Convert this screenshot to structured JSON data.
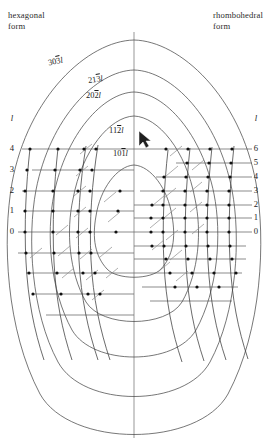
{
  "figure": {
    "type": "reciprocal-lattice-diagram",
    "width": 269,
    "height": 441,
    "background": "#ffffff",
    "ink": "#1a1a1a",
    "curve_color": "#4a4a4a",
    "grid_color": "#555555"
  },
  "headers": {
    "left": "hexagonal\nform",
    "right": "rhombohedral\nform"
  },
  "axes": {
    "left": {
      "symbol": "l",
      "ticks": [
        "4",
        "3",
        "2",
        "1",
        "0"
      ],
      "values": [
        4,
        3,
        2,
        1,
        0
      ],
      "x_px": 12,
      "tick_y_px": [
        149,
        170,
        191,
        211,
        232
      ],
      "spacing_px": 20.8,
      "count": 5
    },
    "right": {
      "symbol": "l",
      "ticks": [
        "6",
        "5",
        "4",
        "3",
        "2",
        "1",
        "0"
      ],
      "values": [
        6,
        5,
        4,
        3,
        2,
        1,
        0
      ],
      "x_px": 253,
      "tick_y_px": [
        149,
        163,
        177,
        191,
        205,
        218,
        232
      ],
      "spacing_px": 13.85,
      "count": 7
    }
  },
  "curve_labels": [
    {
      "id": "303l",
      "hkl": "30",
      "bar": "3",
      "tail": "l",
      "x": 48,
      "y": 62
    },
    {
      "id": "213l",
      "hkl": "21",
      "bar": "3",
      "tail": "l",
      "x": 88,
      "y": 80
    },
    {
      "id": "202l",
      "hkl": "20",
      "bar": "2",
      "tail": "l",
      "x": 86,
      "y": 96
    },
    {
      "id": "112l",
      "hkl": "11",
      "bar": "2",
      "tail": "l",
      "x": 109,
      "y": 131
    },
    {
      "id": "101l",
      "hkl": "10",
      "bar": "1",
      "tail": "l",
      "x": 113,
      "y": 154
    }
  ],
  "curves": {
    "count": 5,
    "note": "Nested closed loops (parabolic arcs) sharing the vertical centre line",
    "center_x": 134,
    "apex_y": [
      40,
      70,
      92,
      116,
      165
    ],
    "bottom_y": [
      435,
      391,
      351,
      312,
      274
    ],
    "half_width": [
      126,
      103,
      82,
      61,
      38
    ]
  },
  "grid": {
    "vertical_axis_x": 134,
    "left_grid_lines": 11,
    "right_grid_lines": 15,
    "lattice_dot_color": "#111111",
    "lattice_dot_radius_px": 1.6
  }
}
